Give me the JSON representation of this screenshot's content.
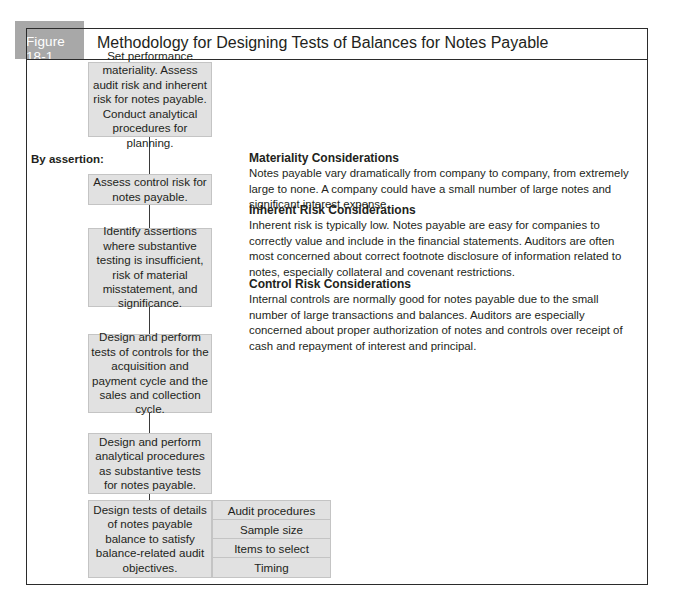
{
  "figure": {
    "label": "Figure 18-1",
    "title": "Methodology for Designing Tests of Balances for Notes Payable",
    "label_bg_color": "#a8a8a8",
    "box_fill_color": "#e1e1e1"
  },
  "flow": {
    "by_assertion_label": "By assertion:",
    "steps": [
      {
        "text": "Set performance materiality. Assess audit risk and inherent risk for notes payable. Conduct analytical procedures for planning."
      },
      {
        "text": "Assess control risk for notes payable."
      },
      {
        "text": "Identify assertions where substantive testing is insufficient, risk of material misstatement, and significance."
      },
      {
        "text": "Design and perform tests of controls for the acquisition and payment cycle and the sales and collection cycle."
      },
      {
        "text": "Design and perform analytical procedures as substantive tests for notes payable."
      },
      {
        "text": "Design tests of details of notes payable balance to satisfy balance-related audit objectives."
      }
    ],
    "details_table": [
      "Audit procedures",
      "Sample size",
      "Items to select",
      "Timing"
    ]
  },
  "considerations": [
    {
      "heading": "Materiality Considerations",
      "body": "Notes payable vary dramatically from company to company, from extremely large to none. A company could have a small number of large notes and significant interest expense."
    },
    {
      "heading": "Inherent Risk Considerations",
      "body": "Inherent risk is typically low. Notes payable are easy for companies to correctly value and include in the financial statements. Auditors are often most concerned about correct footnote disclosure of information related to notes, especially collateral and covenant restrictions."
    },
    {
      "heading": "Control Risk Considerations",
      "body": "Internal controls are normally good for notes payable due to the small number of large transactions and balances. Auditors are especially concerned about proper authorization of notes and controls over receipt of cash and repayment of interest and principal."
    }
  ]
}
